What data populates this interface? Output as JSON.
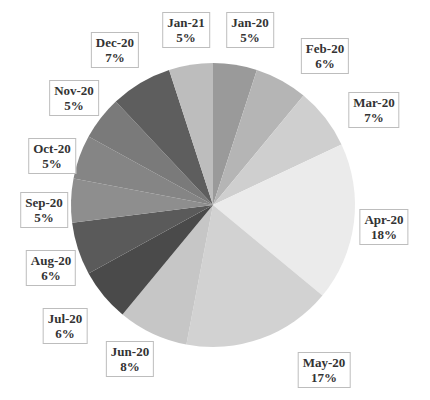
{
  "chart_data": {
    "type": "pie",
    "title": "",
    "center": [
      213,
      205
    ],
    "radius": 142,
    "start_angle_deg": 0,
    "direction": "clockwise",
    "slices": [
      {
        "label": "Jan-20",
        "percent": "5%",
        "value": 5,
        "color": "#9a9a9a",
        "label_pos": [
          250,
          30
        ]
      },
      {
        "label": "Feb-20",
        "percent": "6%",
        "value": 6,
        "color": "#b5b5b5",
        "label_pos": [
          325,
          56
        ]
      },
      {
        "label": "Mar-20",
        "percent": "7%",
        "value": 7,
        "color": "#cfcfcf",
        "label_pos": [
          374,
          110
        ]
      },
      {
        "label": "Apr-20",
        "percent": "18%",
        "value": 18,
        "color": "#ebebeb",
        "label_pos": [
          384,
          227
        ]
      },
      {
        "label": "May-20",
        "percent": "17%",
        "value": 17,
        "color": "#d2d2d2",
        "label_pos": [
          324,
          370
        ]
      },
      {
        "label": "Jun-20",
        "percent": "8%",
        "value": 8,
        "color": "#c6c6c6",
        "label_pos": [
          130,
          359
        ]
      },
      {
        "label": "Jul-20",
        "percent": "6%",
        "value": 6,
        "color": "#4a4a4a",
        "label_pos": [
          65,
          326
        ]
      },
      {
        "label": "Aug-20",
        "percent": "6%",
        "value": 6,
        "color": "#5a5a5a",
        "label_pos": [
          51,
          268
        ]
      },
      {
        "label": "Sep-20",
        "percent": "5%",
        "value": 5,
        "color": "#8e8e8e",
        "label_pos": [
          44,
          210
        ]
      },
      {
        "label": "Oct-20",
        "percent": "5%",
        "value": 5,
        "color": "#858585",
        "label_pos": [
          52,
          156
        ]
      },
      {
        "label": "Nov-20",
        "percent": "5%",
        "value": 5,
        "color": "#7a7a7a",
        "label_pos": [
          74,
          98
        ]
      },
      {
        "label": "Dec-20",
        "percent": "7%",
        "value": 7,
        "color": "#5e5e5e",
        "label_pos": [
          115,
          50
        ]
      },
      {
        "label": "Jan-21",
        "percent": "5%",
        "value": 5,
        "color": "#bdbdbd",
        "label_pos": [
          186,
          30
        ]
      }
    ],
    "categories": [
      "Jan-20",
      "Feb-20",
      "Mar-20",
      "Apr-20",
      "May-20",
      "Jun-20",
      "Jul-20",
      "Aug-20",
      "Sep-20",
      "Oct-20",
      "Nov-20",
      "Dec-20",
      "Jan-21"
    ],
    "values": [
      5,
      6,
      7,
      18,
      17,
      8,
      6,
      6,
      5,
      5,
      5,
      7,
      5
    ],
    "legend": "none (data labels with category and percentage)"
  }
}
